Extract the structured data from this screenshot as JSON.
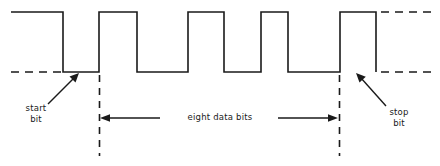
{
  "diagram": {
    "stroke_color": "#1a1a1a",
    "background_color": "#ffffff",
    "labels": {
      "start_bit_line1": "start",
      "start_bit_line2": "bit",
      "stop_bit_line1": "stop",
      "stop_bit_line2": "bit",
      "data_bits": "eight data bits"
    },
    "levels": {
      "high_y": 12,
      "low_y": 72
    },
    "idle_dash_left": {
      "x1": 11,
      "x2": 63,
      "y": 72
    },
    "idle_dash_right_high": {
      "x1": 381,
      "x2": 430,
      "y": 12
    },
    "idle_dash_right_low": {
      "x1": 381,
      "x2": 430,
      "y": 72
    },
    "waveform_points": "11,12 63,12 63,72 99,72 99,12 137,12 137,72 188,72 188,12 224,12 224,72 261,72 261,12 288,12 288,72 340,72 340,12 376,12 376,72",
    "frame_markers": [
      {
        "name": "data-start-marker",
        "x": 99,
        "y1": 75,
        "y2": 155
      },
      {
        "name": "data-end-marker",
        "x": 340,
        "y1": 75,
        "y2": 155
      }
    ],
    "span_arrows": {
      "left_arrow": {
        "tip_x": 100,
        "tail_x": 160,
        "y": 118
      },
      "right_arrow": {
        "tip_x": 338,
        "tail_x": 278,
        "y": 118
      }
    },
    "callout_arrows": [
      {
        "name": "start-bit-callout",
        "tail_x": 48,
        "tail_y": 104,
        "tip_x": 79,
        "tip_y": 73
      },
      {
        "name": "stop-bit-callout",
        "tail_x": 386,
        "tail_y": 106,
        "tip_x": 356,
        "tip_y": 73
      }
    ]
  }
}
